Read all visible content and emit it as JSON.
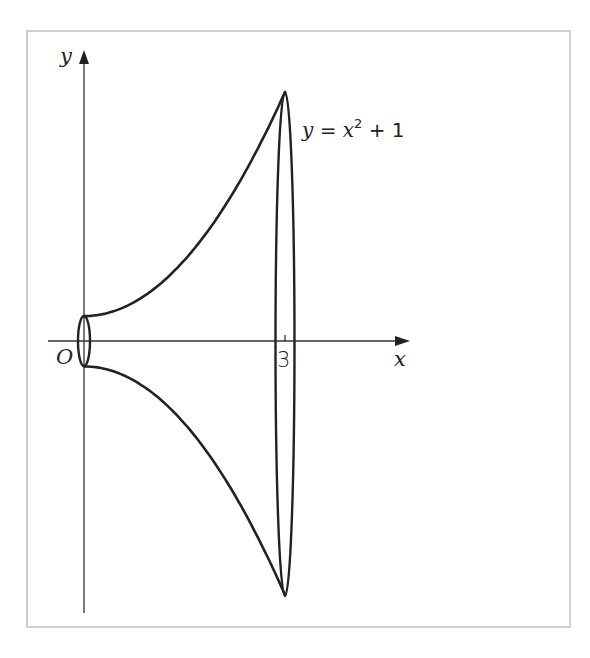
{
  "chart_data": {
    "type": "diagram",
    "title": "",
    "curve": {
      "equation_label": "y = x² + 1",
      "function": "x^2 + 1",
      "x_range": [
        0,
        3
      ]
    },
    "axes": {
      "xlabel": "x",
      "ylabel": "y",
      "origin_label": "O"
    },
    "ticks": {
      "x": [
        {
          "value": 3,
          "label": "3"
        }
      ]
    },
    "cross_sections": [
      {
        "x": 0,
        "radius": 1
      },
      {
        "x": 3,
        "radius": 10
      }
    ]
  },
  "labels": {
    "y_axis": "y",
    "x_axis": "x",
    "origin": "O",
    "tick_3": "3",
    "eq_y": "y",
    "eq_eq": " = ",
    "eq_x": "x",
    "eq_exp": "2",
    "eq_plus": " + 1"
  },
  "colors": {
    "ink": "#222222",
    "frame": "#cfcfcf",
    "background": "#ffffff"
  }
}
